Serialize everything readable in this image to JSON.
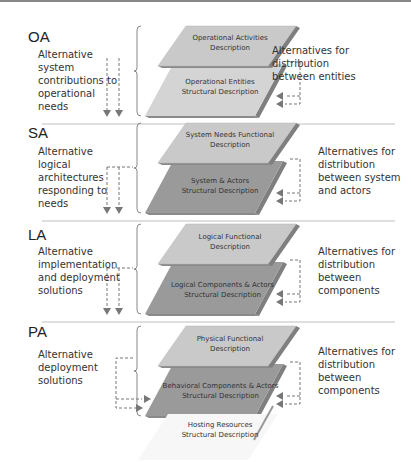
{
  "sections": [
    {
      "id": "oa",
      "label": "OA",
      "left_text": "Alternative\nsystem\ncontributions to\noperational\nneeds",
      "right_text": "Alternatives for\ndistribution\nbetween entities",
      "top_layer": "Operational Activities\nDescription",
      "bottom_layer": "Operational Entities\nStructural Description"
    },
    {
      "id": "sa",
      "label": "SA",
      "left_text": "Alternative\nlogical\narchitectures\nresponding to\nneeds",
      "right_text": "Alternatives for\ndistribution\nbetween system\nand actors",
      "top_layer": "System Needs Functional\nDescription",
      "bottom_layer": "System & Actors\nStructural Description"
    },
    {
      "id": "la",
      "label": "LA",
      "left_text": "Alternative\nimplementation\nand deployment\nsolutions",
      "right_text": "Alternatives for\ndistribution\nbetween\ncomponents",
      "top_layer": "Logical Functional\nDescription",
      "bottom_layer": "Logical Components & Actors\nStructural Description"
    },
    {
      "id": "pa",
      "label": "PA",
      "left_text": "Alternative\ndeployment\nsolutions",
      "right_text": "Alternatives for\ndistribution\nbetween\ncomponents",
      "top_layer": "Physical Functional\nDescription",
      "bottom_layer": "Behavioral Components & Actors\nStructural Description",
      "extra_layer": "Hosting Resources\nStructural Description"
    }
  ],
  "colors": {
    "top_layer": "#c9c9c9",
    "oa_bottom_layer": "#d4d4d4",
    "dark_bottom_layer": "#9a9a9a",
    "hosting_layer": "#f7f7f7",
    "arrow": "#777777",
    "separator": "#bfbfbf"
  }
}
